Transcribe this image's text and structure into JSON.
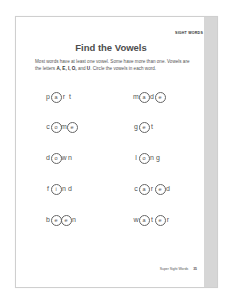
{
  "page": {
    "section_tag": "Sight Words",
    "title": "Find the Vowels",
    "intro_part1": "Most words have at least one vowel. Some have more than one. Vowels are the letters ",
    "intro_letters": "A, E, I, O,",
    "intro_part2": " and ",
    "intro_u": "U",
    "intro_part3": ". Circle the vowels in each word.",
    "words": [
      {
        "word": "part",
        "letters": [
          {
            "c": "p",
            "v": false
          },
          {
            "c": "a",
            "v": true
          },
          {
            "c": "r",
            "v": false
          },
          {
            "c": "t",
            "v": false
          }
        ]
      },
      {
        "word": "made",
        "letters": [
          {
            "c": "m",
            "v": false
          },
          {
            "c": "a",
            "v": true
          },
          {
            "c": "d",
            "v": false
          },
          {
            "c": "e",
            "v": true
          }
        ]
      },
      {
        "word": "come",
        "letters": [
          {
            "c": "c",
            "v": false
          },
          {
            "c": "o",
            "v": true
          },
          {
            "c": "m",
            "v": false
          },
          {
            "c": "e",
            "v": true
          }
        ]
      },
      {
        "word": "get",
        "letters": [
          {
            "c": "g",
            "v": false
          },
          {
            "c": "e",
            "v": true
          },
          {
            "c": "t",
            "v": false
          }
        ]
      },
      {
        "word": "down",
        "letters": [
          {
            "c": "d",
            "v": false
          },
          {
            "c": "o",
            "v": true
          },
          {
            "c": "w",
            "v": false
          },
          {
            "c": "n",
            "v": false
          }
        ]
      },
      {
        "word": "long",
        "letters": [
          {
            "c": "l",
            "v": false
          },
          {
            "c": "o",
            "v": true
          },
          {
            "c": "n",
            "v": false
          },
          {
            "c": "g",
            "v": false
          }
        ]
      },
      {
        "word": "find",
        "letters": [
          {
            "c": "f",
            "v": false
          },
          {
            "c": "i",
            "v": true
          },
          {
            "c": "n",
            "v": false
          },
          {
            "c": "d",
            "v": false
          }
        ]
      },
      {
        "word": "cared",
        "letters": [
          {
            "c": "c",
            "v": false
          },
          {
            "c": "a",
            "v": true
          },
          {
            "c": "r",
            "v": false
          },
          {
            "c": "e",
            "v": true
          },
          {
            "c": "d",
            "v": false
          }
        ]
      },
      {
        "word": "been",
        "letters": [
          {
            "c": "b",
            "v": false
          },
          {
            "c": "e",
            "v": true
          },
          {
            "c": "e",
            "v": true
          },
          {
            "c": "n",
            "v": false
          }
        ]
      },
      {
        "word": "water",
        "letters": [
          {
            "c": "w",
            "v": false
          },
          {
            "c": "a",
            "v": true
          },
          {
            "c": "t",
            "v": false
          },
          {
            "c": "e",
            "v": true
          },
          {
            "c": "r",
            "v": false
          }
        ]
      }
    ],
    "footer_label": "Super Sight Words",
    "page_number": "35"
  }
}
